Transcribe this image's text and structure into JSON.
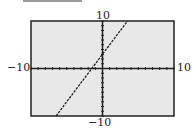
{
  "chart_data": {
    "type": "line",
    "title": "",
    "xlabel": "",
    "ylabel": "",
    "xlim": [
      -10,
      10
    ],
    "ylim": [
      -10,
      10
    ],
    "xticks_step": 1,
    "yticks_step": 1,
    "grid": false,
    "legend": null,
    "series": [
      {
        "name": "y = 2x + 3",
        "style": "dashed",
        "x": [
          -6.5,
          3.5
        ],
        "y": [
          -10,
          10
        ]
      }
    ],
    "tick_labels": {
      "x_min": "−10",
      "x_max": "10",
      "y_min": "−10",
      "y_max": "10"
    }
  },
  "colors": {
    "plot_bg": "#e8e8e8",
    "frame": "#222222",
    "line": "#222222"
  }
}
